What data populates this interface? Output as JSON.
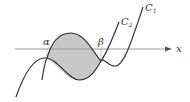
{
  "diagram": {
    "type": "function-graph",
    "axis_label": "x",
    "curves": [
      {
        "name": "C",
        "subscript": "1",
        "label": "C1"
      },
      {
        "name": "C",
        "subscript": "2",
        "label": "C2"
      }
    ],
    "intersection_labels": [
      "α",
      "β"
    ],
    "shaded_region": "area enclosed between C1 and C2 from α to β",
    "colors": {
      "stroke": "#333333",
      "axis": "#999999",
      "shade": "#c8c8c8"
    }
  }
}
